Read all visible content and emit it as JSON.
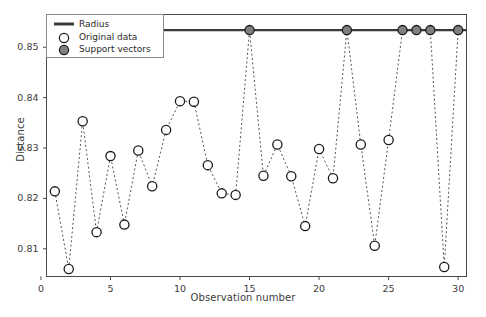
{
  "chart_data": {
    "type": "scatter",
    "title": "",
    "xlabel": "Observation number",
    "ylabel": "Distance",
    "xlim": [
      0.4,
      30.6
    ],
    "ylim": [
      0.8045,
      0.8565
    ],
    "xticks": [
      0,
      5,
      10,
      15,
      20,
      25,
      30
    ],
    "xticklabels": [
      "0",
      "5",
      "10",
      "15",
      "20",
      "25",
      "30"
    ],
    "yticks": [
      0.81,
      0.82,
      0.83,
      0.84,
      0.85
    ],
    "yticklabels": [
      "0.81",
      "0.82",
      "0.83",
      "0.84",
      "0.85"
    ],
    "grid": false,
    "legend_position": "upper left",
    "radius_value": 0.8534,
    "x": [
      1,
      2,
      3,
      4,
      5,
      6,
      7,
      8,
      9,
      10,
      11,
      12,
      13,
      14,
      15,
      16,
      17,
      18,
      19,
      20,
      21,
      22,
      23,
      24,
      25,
      26,
      27,
      28,
      29,
      30
    ],
    "values": [
      0.8214,
      0.806,
      0.8353,
      0.8133,
      0.8284,
      0.8148,
      0.8295,
      0.8224,
      0.8336,
      0.8393,
      0.8392,
      0.8266,
      0.821,
      0.8207,
      0.8534,
      0.8245,
      0.8307,
      0.8244,
      0.8145,
      0.8298,
      0.824,
      0.8534,
      0.8307,
      0.8106,
      0.8316,
      0.8534,
      0.8534,
      0.8534,
      0.8064,
      0.8534
    ],
    "support_vectors": [
      15,
      22,
      26,
      27,
      28,
      30
    ],
    "series": [
      {
        "name": "Radius",
        "type": "line",
        "value": 0.8534,
        "color": "#3a3a3a"
      },
      {
        "name": "Original data",
        "type": "marker",
        "marker": "open-circle",
        "color": "#ffffff",
        "edge_color": "#1a1a1a"
      },
      {
        "name": "Support vectors",
        "type": "marker",
        "marker": "filled-circle",
        "color": "#808080",
        "edge_color": "#1a1a1a"
      }
    ]
  },
  "legend": {
    "entries": [
      {
        "label": "Radius",
        "marker": "line-swatch"
      },
      {
        "label": "Original data",
        "marker": "open-circle"
      },
      {
        "label": "Support vectors",
        "marker": "filled-circle"
      }
    ]
  },
  "colors": {
    "radius_line": "#3a3a3a",
    "connector_line": "#555555",
    "marker_edge": "#1a1a1a",
    "marker_face_open": "#ffffff",
    "marker_face_support": "#808080",
    "axis": "#4a4a4a",
    "text": "#3b3b3b"
  }
}
